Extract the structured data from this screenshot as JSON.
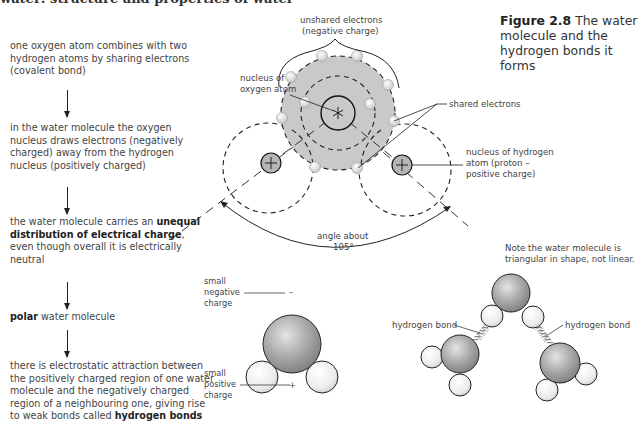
{
  "page": {
    "clipped_heading": "water: structure and properties of water"
  },
  "flowchart": {
    "steps": [
      {
        "text": "one oxygen atom combines with two hydrogen atoms by sharing electrons (covalent bond)"
      },
      {
        "text": "in the water molecule the oxygen nucleus draws electrons (negatively charged) away from the hydrogen nucleus (positively charged)"
      },
      {
        "pre": "the water molecule carries an ",
        "bold": "unequal distribution of electrical charge",
        "post": ", even though overall it is electrically neutral"
      },
      {
        "bold": "polar",
        "post": " water molecule"
      },
      {
        "pre": "there is electrostatic attraction between the positively charged region of one water molecule and the negatively charged region of a neighbouring one, giving rise to weak bonds called ",
        "bold": "hydrogen bonds"
      }
    ]
  },
  "caption": {
    "figure_number": "Figure 2.8",
    "text": " The water molecule and the hydrogen bonds it forms"
  },
  "diagram": {
    "labels": {
      "unshared_line1": "unshared electrons",
      "unshared_line2": "(negative charge)",
      "o_nucleus_line1": "nucleus of",
      "o_nucleus_line2": "oxygen atom",
      "shared_electrons": "shared electrons",
      "h_nucleus_line1": "nucleus of hydrogen",
      "h_nucleus_line2": "atom (proton –",
      "h_nucleus_line3": "positive charge)",
      "angle_line1": "angle about",
      "angle_line2": "105°",
      "note_line1": "Note the water molecule is",
      "note_line2": "triangular in shape, not linear.",
      "neg_line1": "small",
      "neg_line2": "negative",
      "neg_line3": "charge",
      "neg_symbol": "–",
      "pos_line1": "small",
      "pos_line2": "positive",
      "pos_line3": "charge",
      "pos_symbol": "+",
      "hbond_left": "hydrogen bond",
      "hbond_right": "hydrogen bond"
    },
    "colors": {
      "oxygen_shell": "#c9c9c9",
      "hydrogen_nucleus": "#b5b5b5",
      "electron": "#e2e2e2",
      "line": "#222222",
      "oxygen_ball": "#9a9a9a",
      "hydrogen_ball": "#eeeeee"
    }
  }
}
